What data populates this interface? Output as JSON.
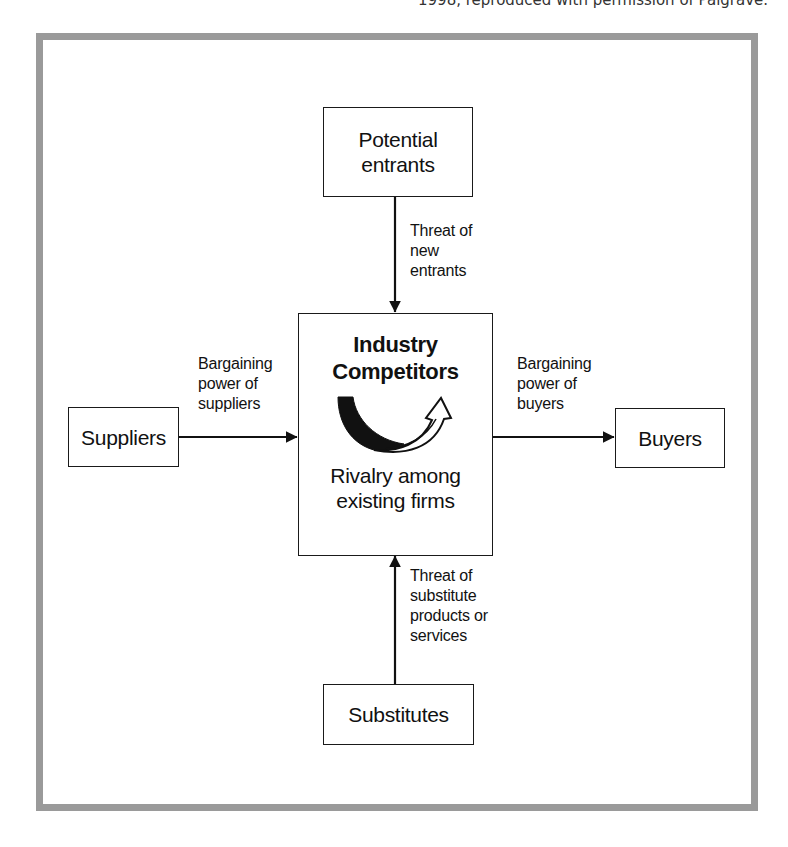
{
  "caption": {
    "text": "1998, reproduced with permission of Palgrave."
  },
  "diagram": {
    "nodes": {
      "potential_entrants": {
        "lines": [
          "Potential",
          "entrants"
        ]
      },
      "industry_competitors": {
        "title_lines": [
          "Industry",
          "Competitors"
        ],
        "sub_lines": [
          "Rivalry among",
          "existing firms"
        ],
        "icon": "curved-rivalry-arrow-icon"
      },
      "suppliers": {
        "lines": [
          "Suppliers"
        ]
      },
      "buyers": {
        "lines": [
          "Buyers"
        ]
      },
      "substitutes": {
        "lines": [
          "Substitutes"
        ]
      }
    },
    "edges": {
      "new_entrants": {
        "from": "Potential entrants",
        "to": "Industry Competitors",
        "lines": [
          "Threat of",
          "new",
          "entrants"
        ]
      },
      "suppliers": {
        "from": "Suppliers",
        "to": "Industry Competitors",
        "lines": [
          "Bargaining",
          "power of",
          "suppliers"
        ]
      },
      "buyers": {
        "from": "Industry Competitors",
        "to": "Buyers",
        "lines": [
          "Bargaining",
          "power of",
          "buyers"
        ]
      },
      "substitutes": {
        "from": "Substitutes",
        "to": "Industry Competitors",
        "lines": [
          "Threat of",
          "substitute",
          "products or",
          "services"
        ]
      }
    },
    "colors": {
      "frame_border": "#9a9a9a",
      "line": "#111111",
      "background": "#ffffff"
    }
  }
}
